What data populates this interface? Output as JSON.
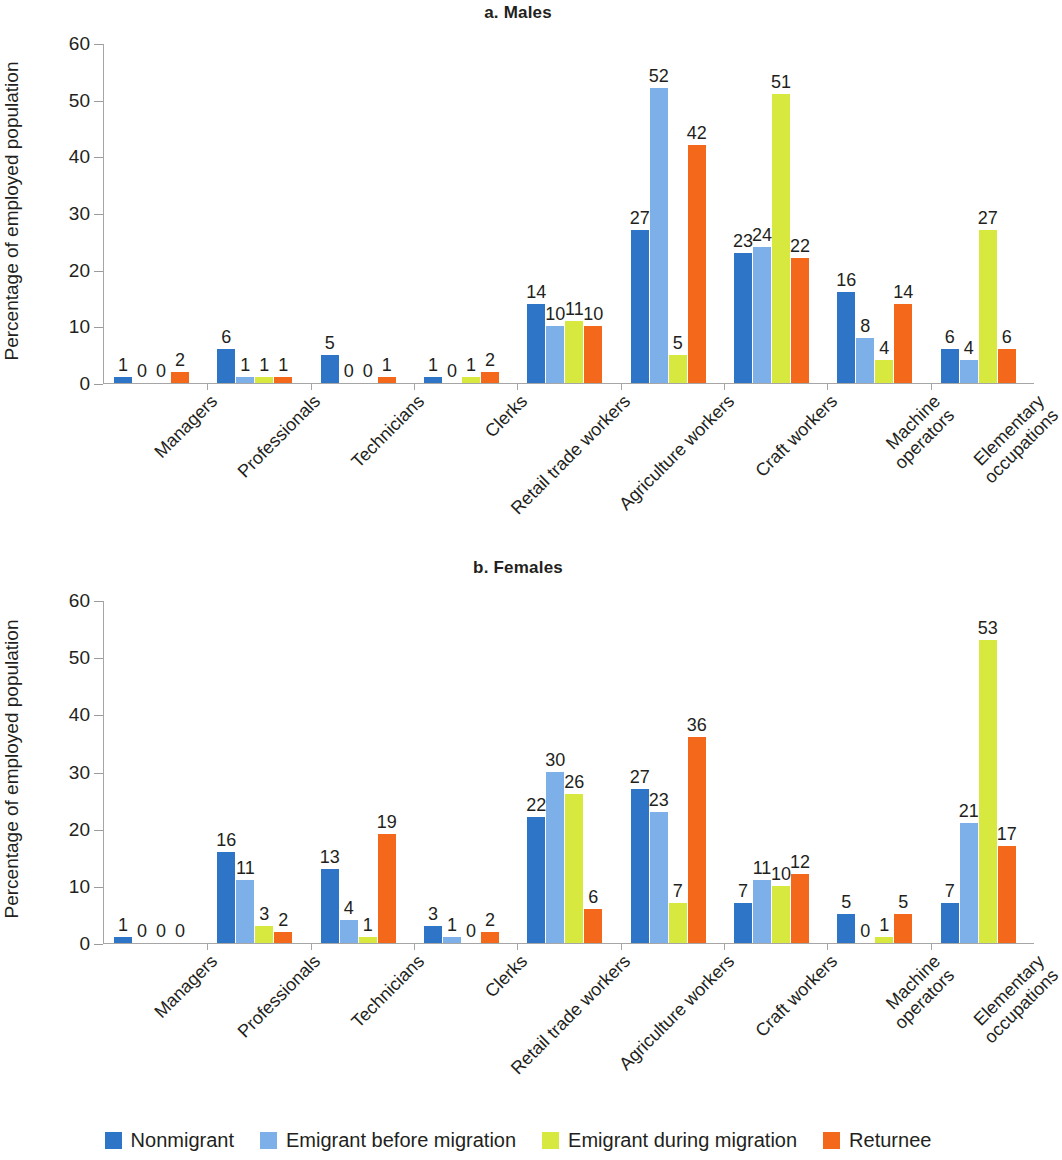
{
  "figure": {
    "ylabel": "Percentage of employed population",
    "yticks": [
      0,
      10,
      20,
      30,
      40,
      50,
      60
    ],
    "panels": [
      {
        "id": "males",
        "title": "a. Males"
      },
      {
        "id": "females",
        "title": "b. Females"
      }
    ]
  },
  "legend": {
    "items": [
      {
        "label": "Nonmigrant",
        "color": "#2e75c8"
      },
      {
        "label": "Emigrant before migration",
        "color": "#7dafe8"
      },
      {
        "label": "Emigrant during migration",
        "color": "#d7e83f"
      },
      {
        "label": "Returnee",
        "color": "#f4681c"
      }
    ]
  },
  "chart_data": [
    {
      "type": "bar",
      "title": "a. Males",
      "xlabel": "",
      "ylabel": "Percentage of employed population",
      "ylim": [
        0,
        60
      ],
      "yticks": [
        0,
        10,
        20,
        30,
        40,
        50,
        60
      ],
      "grid": false,
      "legend_position": "bottom",
      "categories": [
        "Managers",
        "Professionals",
        "Technicians",
        "Clerks",
        "Retail trade workers",
        "Agriculture workers",
        "Craft workers",
        "Machine operators",
        "Elementary\noccupations"
      ],
      "series": [
        {
          "name": "Nonmigrant",
          "color": "#2e75c8",
          "values": [
            1,
            6,
            5,
            1,
            14,
            27,
            23,
            16,
            6
          ]
        },
        {
          "name": "Emigrant before migration",
          "color": "#7dafe8",
          "values": [
            0,
            1,
            0,
            0,
            10,
            52,
            24,
            8,
            4
          ]
        },
        {
          "name": "Emigrant during migration",
          "color": "#d7e83f",
          "values": [
            0,
            1,
            0,
            1,
            11,
            5,
            51,
            4,
            27
          ]
        },
        {
          "name": "Returnee",
          "color": "#f4681c",
          "values": [
            2,
            1,
            1,
            2,
            10,
            42,
            22,
            14,
            6
          ]
        }
      ]
    },
    {
      "type": "bar",
      "title": "b. Females",
      "xlabel": "",
      "ylabel": "Percentage of employed population",
      "ylim": [
        0,
        60
      ],
      "yticks": [
        0,
        10,
        20,
        30,
        40,
        50,
        60
      ],
      "grid": false,
      "legend_position": "bottom",
      "categories": [
        "Managers",
        "Professionals",
        "Technicians",
        "Clerks",
        "Retail trade workers",
        "Agriculture workers",
        "Craft workers",
        "Machine operators",
        "Elementary\noccupations"
      ],
      "series": [
        {
          "name": "Nonmigrant",
          "color": "#2e75c8",
          "values": [
            1,
            16,
            13,
            3,
            22,
            27,
            7,
            5,
            7
          ]
        },
        {
          "name": "Emigrant before migration",
          "color": "#7dafe8",
          "values": [
            0,
            11,
            4,
            1,
            30,
            23,
            11,
            0,
            21
          ]
        },
        {
          "name": "Emigrant during migration",
          "color": "#d7e83f",
          "values": [
            0,
            3,
            1,
            0,
            26,
            7,
            10,
            1,
            53
          ]
        },
        {
          "name": "Returnee",
          "color": "#f4681c",
          "values": [
            0,
            2,
            19,
            2,
            6,
            36,
            12,
            5,
            17
          ]
        }
      ]
    }
  ]
}
